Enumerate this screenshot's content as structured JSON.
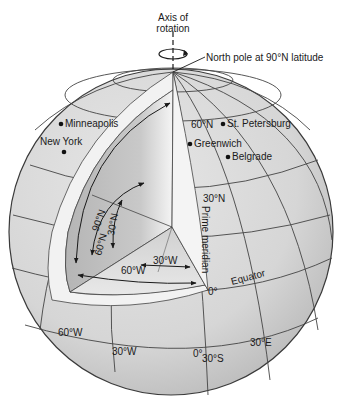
{
  "diagram": {
    "type": "globe-latitude-longitude",
    "axis_label_line1": "Axis of",
    "axis_label_line2": "rotation",
    "north_pole_label": "North pole at 90°N latitude",
    "cities": [
      {
        "name": "Minneapolis"
      },
      {
        "name": "New York"
      },
      {
        "name": "St. Petersburg"
      },
      {
        "name": "Greenwich"
      },
      {
        "name": "Belgrade"
      }
    ],
    "latitude_labels": {
      "lat_60n": "60°N",
      "lat_30n": "30°N",
      "equator_deg": "0°",
      "lat_30s": "30°S"
    },
    "cutaway_labels": {
      "arc_90n": "90°N",
      "arc_60n": "60°N",
      "arc_30n": "30°N",
      "arc_30w": "30°W",
      "arc_60w": "60°W"
    },
    "longitude_labels": {
      "lon_60w": "60°W",
      "lon_30w": "30°W",
      "lon_0": "0°",
      "lon_30e": "30°E"
    },
    "feature_labels": {
      "prime_meridian": "Prime meridian",
      "equator": "Equator"
    },
    "colors": {
      "globe_fill": "#d9d9d9",
      "globe_stroke": "#3a3a3a",
      "grid_line": "#444444",
      "cutaway_band": "#f2f2f2",
      "cutaway_interior": "#bdbdbd",
      "text": "#1a1a1a"
    }
  }
}
